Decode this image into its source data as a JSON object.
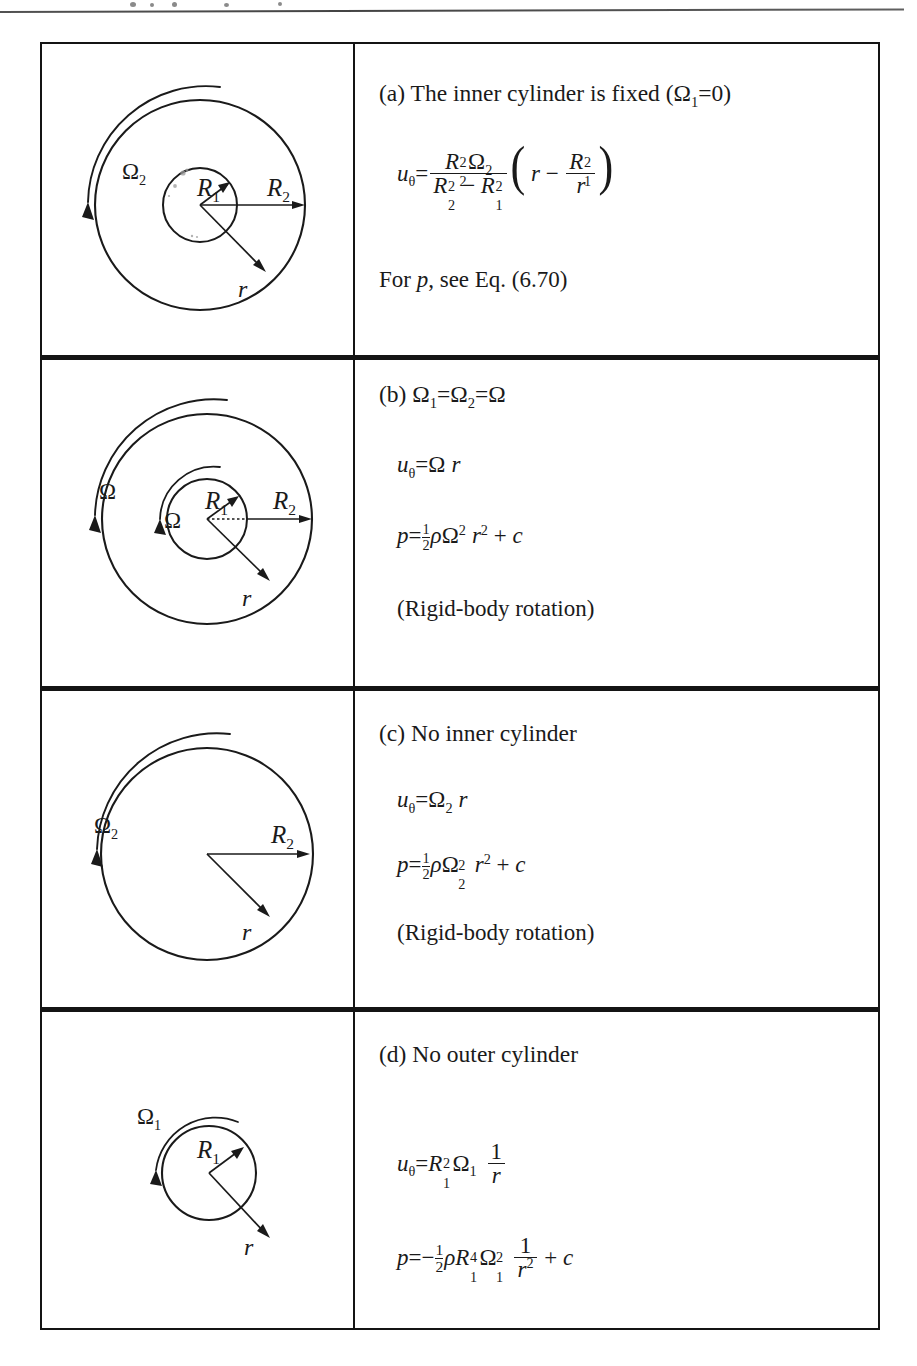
{
  "page": {
    "top_rule": true
  },
  "table": {
    "rows": [
      {
        "key": "a",
        "figure": {
          "name": "annulus-two-cylinders-outer-rotating",
          "labels": {
            "omega": "Ω",
            "omega_sub": "2",
            "r1": "R",
            "r1_sub": "1",
            "r2": "R",
            "r2_sub": "2",
            "r": "r"
          }
        },
        "heading": "(a) The inner cylinder is fixed (Ω₁=0)",
        "heading_parts": {
          "prefix": "(a) The inner cylinder is fixed (",
          "omega": "Ω",
          "omega_sub": "1",
          "eq_zero": "=0)"
        },
        "equations": [
          {
            "name": "u-theta-equation",
            "latex": "u_\\theta = \\frac{R_2^2 \\Omega_2}{R_2^2 - R_1^2}\\left(r - \\frac{R_1^2}{r}\\right)",
            "plain": "u_θ = R₂²Ω₂/(R₂²−R₁²) (r − R₁²/r)"
          }
        ],
        "note": "For p, see Eq. (6.70)",
        "note_parts": {
          "before": "For ",
          "symbol": "p",
          "after": ", see Eq. (6.70)"
        }
      },
      {
        "key": "b",
        "figure": {
          "name": "annulus-two-cylinders-both-rotating",
          "labels": {
            "omega_outer": "Ω",
            "omega_inner": "Ω",
            "r1": "R",
            "r1_sub": "1",
            "r2": "R",
            "r2_sub": "2",
            "r": "r"
          }
        },
        "heading": "(b) Ω₁=Ω₂=Ω",
        "heading_parts": {
          "prefix": "(b) ",
          "omega1": "Ω",
          "omega1_sub": "1",
          "eq1": "=",
          "omega2": "Ω",
          "omega2_sub": "2",
          "eq2": "=",
          "omega3": "Ω"
        },
        "equations": [
          {
            "name": "u-theta-equation",
            "latex": "u_\\theta = \\Omega\\, r",
            "plain": "u_θ = Ω r"
          },
          {
            "name": "pressure-equation",
            "latex": "p = \\tfrac{1}{2}\\rho\\Omega^2 r^2 + c",
            "plain": "p = ½ρΩ² r² + c"
          }
        ],
        "note": "(Rigid-body rotation)"
      },
      {
        "key": "c",
        "figure": {
          "name": "single-cylinder-no-inner",
          "labels": {
            "omega": "Ω",
            "omega_sub": "2",
            "r2": "R",
            "r2_sub": "2",
            "r": "r"
          }
        },
        "heading": "(c) No inner cylinder",
        "equations": [
          {
            "name": "u-theta-equation",
            "latex": "u_\\theta = \\Omega_2\\, r",
            "plain": "u_θ = Ω₂ r"
          },
          {
            "name": "pressure-equation",
            "latex": "p = \\tfrac{1}{2}\\rho\\Omega_2^2 r^2 + c",
            "plain": "p = ½ρΩ₂² r² + c"
          }
        ],
        "note": "(Rigid-body rotation)"
      },
      {
        "key": "d",
        "figure": {
          "name": "single-cylinder-no-outer",
          "labels": {
            "omega": "Ω",
            "omega_sub": "1",
            "r1": "R",
            "r1_sub": "1",
            "r": "r"
          }
        },
        "heading": "(d) No outer cylinder",
        "equations": [
          {
            "name": "u-theta-equation",
            "latex": "u_\\theta = R_1^2\\Omega_1\\,\\frac{1}{r}",
            "plain": "u_θ = R₁²Ω₁ 1/r"
          },
          {
            "name": "pressure-equation",
            "latex": "p = -\\tfrac{1}{2}\\rho R_1^4\\Omega_1^2\\,\\frac{1}{r^2} + c",
            "plain": "p = −½ρR₁⁴Ω₁² 1/r² + c"
          }
        ],
        "note": ""
      }
    ]
  },
  "symbols": {
    "omega": "Ω",
    "rho": "ρ",
    "theta": "θ",
    "u": "u",
    "p": "p",
    "r": "r",
    "c": "c",
    "R": "R",
    "minus": "−",
    "plus": "+",
    "equals": "=",
    "one": "1",
    "two": "2",
    "four": "4"
  },
  "colors": {
    "ink": "#1a1a1a",
    "rule": "#141414",
    "paper": "#ffffff"
  }
}
